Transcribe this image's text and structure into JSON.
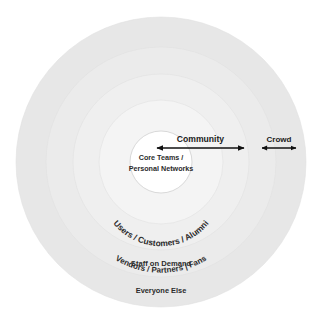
{
  "diagram": {
    "background_color": "#ffffff",
    "center_x": 161,
    "center_y": 162,
    "core": {
      "line1": "Core Teams /",
      "line2": "Personal Networks",
      "radius": 31,
      "fill": "#ffffff",
      "stroke": "#cfcfcf"
    },
    "rings": [
      {
        "id": "ring-users",
        "label": "Users / Customers / Alumni",
        "radius": 62,
        "fill": "#f4f4f4",
        "label_style": "arc"
      },
      {
        "id": "ring-vendors",
        "label": "Vendors / Partners | Fans",
        "radius": 88,
        "fill": "#efefef",
        "label_style": "arc"
      },
      {
        "id": "ring-staff",
        "label": "Staff on Demand",
        "radius": 115,
        "fill": "#ebebeb",
        "label_style": "flat"
      },
      {
        "id": "ring-everyone",
        "label": "Everyone Else",
        "radius": 145,
        "fill": "#e7e7e7",
        "label_style": "flat"
      }
    ],
    "arrows": [
      {
        "id": "community-arrow",
        "label": "Community",
        "x1": 157,
        "x2": 244,
        "y": 148,
        "color": "#111111"
      },
      {
        "id": "crowd-arrow",
        "label": "Crowd",
        "x1": 262,
        "x2": 296,
        "y": 148,
        "color": "#111111"
      }
    ],
    "watermarks": [
      {
        "text": "COMMUNITY",
        "x": 150,
        "y": 60,
        "size": 17,
        "color": "#f3f3f3"
      },
      {
        "text": "AND THE CROWD",
        "x": 150,
        "y": 96,
        "size": 13,
        "color": "#f3f3f3"
      },
      {
        "text": "COMMUNITY & CROWD",
        "x": 150,
        "y": 180,
        "size": 20,
        "color": "#f2f2f2"
      },
      {
        "text": "ORGANIZATIONS",
        "x": 150,
        "y": 205,
        "size": 12,
        "color": "#f3f3f3"
      }
    ]
  }
}
